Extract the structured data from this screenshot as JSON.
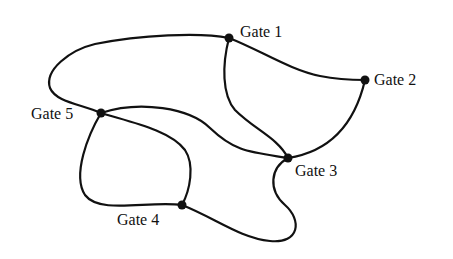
{
  "diagram": {
    "type": "graph",
    "nodes": [
      {
        "id": "g1",
        "label": "Gate 1"
      },
      {
        "id": "g2",
        "label": "Gate 2"
      },
      {
        "id": "g3",
        "label": "Gate 3"
      },
      {
        "id": "g4",
        "label": "Gate 4"
      },
      {
        "id": "g5",
        "label": "Gate 5"
      }
    ],
    "edges": [
      [
        "g5",
        "g1"
      ],
      [
        "g1",
        "g2"
      ],
      [
        "g1",
        "g3"
      ],
      [
        "g2",
        "g3"
      ],
      [
        "g5",
        "g3"
      ],
      [
        "g5",
        "g4"
      ],
      [
        "g5",
        "g4"
      ],
      [
        "g4",
        "g3"
      ]
    ]
  }
}
